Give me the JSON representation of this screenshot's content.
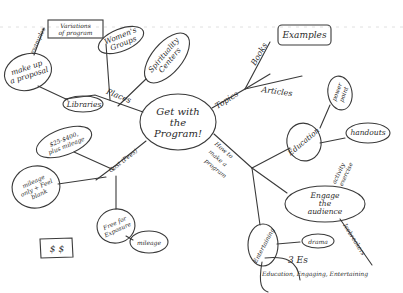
{
  "mindmap": {
    "center": {
      "line1": "Get with",
      "line2": "the",
      "line3": "Program!"
    },
    "branches": {
      "places": {
        "label": "Places",
        "children": {
          "libraries": "Libraries",
          "womens_groups_1": "Women's",
          "womens_groups_2": "Groups",
          "spirituality_1": "Spirituality",
          "spirituality_2": "Centers"
        }
      },
      "make_up_proposal": {
        "line1": "make up",
        "line2": "a proposal",
        "link_label": "examples"
      },
      "variations": {
        "line1": "Variations",
        "line2": "of program"
      },
      "topics": {
        "label": "Topics",
        "children": {
          "books": "Books",
          "articles": "Articles"
        }
      },
      "examples": {
        "label": "Examples"
      },
      "how_to": {
        "label_1": "How to",
        "label_2": "make a",
        "label_3": "program",
        "children": {
          "education": "Education",
          "power_point_1": "power",
          "power_point_2": "point",
          "handouts": "handouts",
          "engage_1": "Engage",
          "engage_2": "the",
          "engage_3": "audience",
          "activity_1": "activity",
          "activity_2": "exercise",
          "icebreakers": "Icebreakers",
          "entertaining": "Entertaining",
          "drama": "drama",
          "three_es": "3 Es",
          "three_es_detail": "Education, Engaging, Entertaining"
        }
      },
      "cost": {
        "label": "Cost (Fees)",
        "children": {
          "fee_1": "$25-$400,",
          "fee_2": "plus mileage",
          "mileage_only_1": "mileage",
          "mileage_only_2": "only + Feel",
          "mileage_only_3": "blank",
          "free_1": "Free for",
          "free_2": "Exposure",
          "mileage": "mileage"
        }
      },
      "money": {
        "label": "$ $"
      }
    }
  }
}
